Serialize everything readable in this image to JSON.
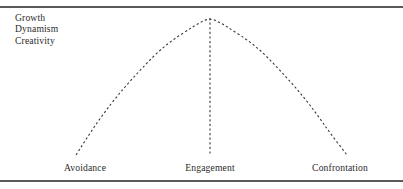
{
  "figure": {
    "kind": "inverted-u-curve-diagram",
    "cut_off_caption": "",
    "annotation": {
      "lines": [
        "Growth",
        "Dynamism",
        "Creativity"
      ]
    },
    "axis_labels": {
      "left": "Avoidance",
      "center": "Engagement",
      "right": "Confrontation"
    },
    "colors": {
      "rule": "#5a5a5a",
      "text": "#2b2b2b",
      "curve": "#3a3a3a"
    }
  },
  "chart_data": {
    "type": "line",
    "title": "",
    "xlabel": "",
    "ylabel": "",
    "style": "dashed inverted-U (parabola), no axes drawn",
    "grid": false,
    "legend": null,
    "categories": [
      "Avoidance",
      "Engagement",
      "Confrontation"
    ],
    "x": [
      0,
      0.5,
      1
    ],
    "values": [
      0,
      1,
      0
    ],
    "xlim": [
      0,
      1
    ],
    "ylim": [
      0,
      1
    ],
    "annotations": [
      {
        "text": "Growth Dynamism Creativity",
        "position": "upper-left",
        "describes": "y-axis / vertical dimension of the curve"
      }
    ],
    "series": [
      {
        "name": "performance-curve",
        "style": "dashed",
        "points_px": [
          [
            76,
            155
          ],
          [
            90,
            133
          ],
          [
            104,
            113
          ],
          [
            118,
            95
          ],
          [
            132,
            79
          ],
          [
            146,
            64
          ],
          [
            160,
            50
          ],
          [
            174,
            39
          ],
          [
            188,
            30
          ],
          [
            199,
            23
          ],
          [
            210,
            18
          ],
          [
            221,
            23
          ],
          [
            232,
            30
          ],
          [
            246,
            39
          ],
          [
            260,
            50
          ],
          [
            274,
            64
          ],
          [
            288,
            79
          ],
          [
            302,
            95
          ],
          [
            316,
            113
          ],
          [
            330,
            133
          ],
          [
            347,
            155
          ]
        ]
      }
    ],
    "reference_line": {
      "orientation": "vertical",
      "style": "dashed",
      "at_category": "Engagement",
      "from_px": [
        210,
        18
      ],
      "to_px": [
        210,
        156
      ]
    }
  }
}
